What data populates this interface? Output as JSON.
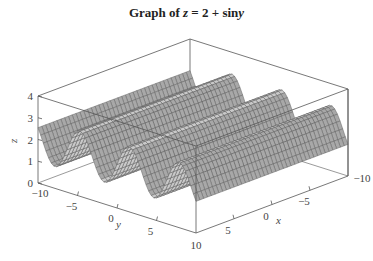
{
  "chart_data": {
    "type": "surface3d",
    "title_parts": {
      "prefix": "Graph of ",
      "z": "z",
      "eq": " = 2 + sin",
      "y": "y"
    },
    "function": "z = 2 + sin(y)",
    "xlabel": "x",
    "ylabel": "y",
    "zlabel": "z",
    "xlim": [
      -10,
      10
    ],
    "ylim": [
      -10,
      10
    ],
    "zlim": [
      0,
      4
    ],
    "x_ticks": [
      -10,
      -5,
      0,
      5,
      10
    ],
    "x_tick_labels": [
      "−10",
      "−5",
      "0",
      "5",
      "10"
    ],
    "y_ticks": [
      -10,
      -5,
      0,
      5,
      10
    ],
    "y_tick_labels": [
      "−10",
      "−5",
      "0",
      "5",
      "10"
    ],
    "z_ticks": [
      0,
      1,
      2,
      3,
      4
    ],
    "z_tick_labels": [
      "0",
      "1",
      "2",
      "3",
      "4"
    ],
    "grid": false,
    "box": true,
    "mesh": {
      "x_steps": 40,
      "y_steps": 60
    },
    "colors": {
      "surface": "#c9c9c9",
      "surface_dark": "#a8a8a8",
      "mesh": "#5a5a5a",
      "box": "#555555",
      "text": "#444444"
    }
  }
}
